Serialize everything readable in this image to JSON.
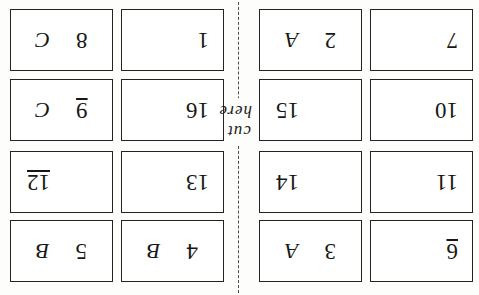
{
  "document": {
    "kind": "scanned-flashcard-sheet",
    "orientation": "upside-down",
    "top_clipped_text_left": "y  p",
    "top_clipped_text_right": "p  g",
    "cut_label": "cut here",
    "ink_color": "#171714",
    "paper_color": "#fdfdfc",
    "border_color": "#23231f"
  },
  "cards": [
    {
      "id": "card-r1c1",
      "primary": "8",
      "secondary": "C",
      "align": "pair",
      "underline": false
    },
    {
      "id": "card-r1c2",
      "primary": "1",
      "secondary": "",
      "align": "left",
      "underline": false
    },
    {
      "id": "card-r1c3",
      "primary": "2",
      "secondary": "A",
      "align": "pair",
      "underline": false
    },
    {
      "id": "card-r1c4",
      "primary": "7",
      "secondary": "",
      "align": "left",
      "underline": false
    },
    {
      "id": "card-r2c1",
      "primary": "9",
      "secondary": "C",
      "align": "pair",
      "underline": true
    },
    {
      "id": "card-r2c2",
      "primary": "16",
      "secondary": "",
      "align": "left",
      "underline": false
    },
    {
      "id": "card-r2c3",
      "primary": "15",
      "secondary": "",
      "align": "right",
      "underline": false
    },
    {
      "id": "card-r2c4",
      "primary": "10",
      "secondary": "",
      "align": "left",
      "underline": false
    },
    {
      "id": "card-r3c1",
      "primary": "12",
      "secondary": "",
      "align": "right",
      "underline": true
    },
    {
      "id": "card-r3c2",
      "primary": "13",
      "secondary": "",
      "align": "left",
      "underline": false
    },
    {
      "id": "card-r3c3",
      "primary": "14",
      "secondary": "",
      "align": "right",
      "underline": false
    },
    {
      "id": "card-r3c4",
      "primary": "11",
      "secondary": "",
      "align": "left",
      "underline": false
    },
    {
      "id": "card-r4c1",
      "primary": "5",
      "secondary": "B",
      "align": "pair",
      "underline": false
    },
    {
      "id": "card-r4c2",
      "primary": "4",
      "secondary": "B",
      "align": "pair",
      "underline": false
    },
    {
      "id": "card-r4c3",
      "primary": "3",
      "secondary": "A",
      "align": "pair",
      "underline": false
    },
    {
      "id": "card-r4c4",
      "primary": "6",
      "secondary": "",
      "align": "left",
      "underline": true
    }
  ]
}
